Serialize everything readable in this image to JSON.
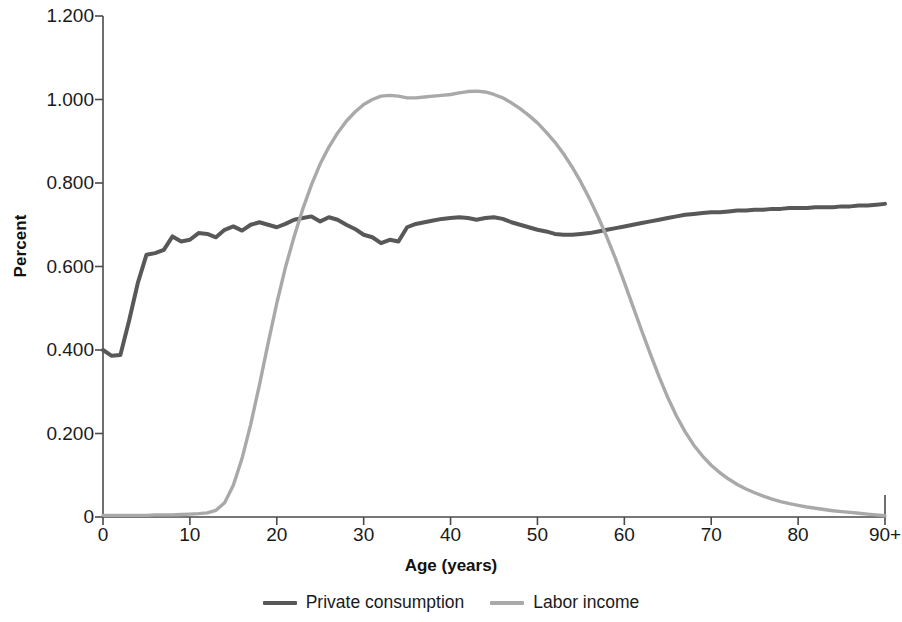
{
  "chart_data": {
    "type": "line",
    "title": "",
    "xlabel": "Age (years)",
    "ylabel": "Percent",
    "xlim": [
      0,
      90
    ],
    "ylim": [
      0,
      1.2
    ],
    "grid": false,
    "legend_position": "bottom-center",
    "x_tick_labels": [
      "0",
      "10",
      "20",
      "30",
      "40",
      "50",
      "60",
      "70",
      "80",
      "90+"
    ],
    "x_tick_values": [
      0,
      10,
      20,
      30,
      40,
      50,
      60,
      70,
      80,
      90
    ],
    "y_tick_labels": [
      "0",
      "0.200",
      "0.400",
      "0.600",
      "0.800",
      "1.000",
      "1.200"
    ],
    "y_tick_values": [
      0,
      0.2,
      0.4,
      0.6,
      0.8,
      1.0,
      1.2
    ],
    "x": [
      0,
      1,
      2,
      3,
      4,
      5,
      6,
      7,
      8,
      9,
      10,
      11,
      12,
      13,
      14,
      15,
      16,
      17,
      18,
      19,
      20,
      21,
      22,
      23,
      24,
      25,
      26,
      27,
      28,
      29,
      30,
      31,
      32,
      33,
      34,
      35,
      36,
      37,
      38,
      39,
      40,
      41,
      42,
      43,
      44,
      45,
      46,
      47,
      48,
      49,
      50,
      51,
      52,
      53,
      54,
      55,
      56,
      57,
      58,
      59,
      60,
      61,
      62,
      63,
      64,
      65,
      66,
      67,
      68,
      69,
      70,
      71,
      72,
      73,
      74,
      75,
      76,
      77,
      78,
      79,
      80,
      81,
      82,
      83,
      84,
      85,
      86,
      87,
      88,
      89,
      90
    ],
    "series": [
      {
        "name": "Private consumption",
        "color": "#585858",
        "values": [
          0.4,
          0.386,
          0.388,
          0.47,
          0.56,
          0.628,
          0.632,
          0.64,
          0.672,
          0.66,
          0.664,
          0.68,
          0.678,
          0.67,
          0.688,
          0.696,
          0.686,
          0.7,
          0.706,
          0.7,
          0.694,
          0.702,
          0.712,
          0.716,
          0.72,
          0.708,
          0.718,
          0.712,
          0.7,
          0.69,
          0.676,
          0.67,
          0.656,
          0.664,
          0.66,
          0.694,
          0.702,
          0.706,
          0.71,
          0.714,
          0.716,
          0.718,
          0.716,
          0.712,
          0.716,
          0.718,
          0.714,
          0.706,
          0.7,
          0.694,
          0.688,
          0.684,
          0.678,
          0.676,
          0.676,
          0.678,
          0.68,
          0.684,
          0.688,
          0.692,
          0.696,
          0.7,
          0.704,
          0.708,
          0.712,
          0.716,
          0.72,
          0.724,
          0.726,
          0.728,
          0.73,
          0.73,
          0.732,
          0.734,
          0.734,
          0.736,
          0.736,
          0.738,
          0.738,
          0.74,
          0.74,
          0.74,
          0.742,
          0.742,
          0.742,
          0.744,
          0.744,
          0.746,
          0.746,
          0.748,
          0.75
        ]
      },
      {
        "name": "Labor income",
        "color": "#a9a9a9",
        "values": [
          0.004,
          0.004,
          0.004,
          0.004,
          0.004,
          0.004,
          0.005,
          0.005,
          0.005,
          0.006,
          0.007,
          0.008,
          0.01,
          0.016,
          0.034,
          0.076,
          0.14,
          0.222,
          0.316,
          0.416,
          0.512,
          0.598,
          0.672,
          0.738,
          0.796,
          0.846,
          0.886,
          0.92,
          0.948,
          0.97,
          0.988,
          1.0,
          1.008,
          1.01,
          1.008,
          1.004,
          1.004,
          1.006,
          1.008,
          1.01,
          1.012,
          1.016,
          1.019,
          1.02,
          1.018,
          1.012,
          1.004,
          0.992,
          0.978,
          0.962,
          0.944,
          0.922,
          0.898,
          0.87,
          0.838,
          0.802,
          0.762,
          0.718,
          0.67,
          0.618,
          0.562,
          0.504,
          0.446,
          0.39,
          0.336,
          0.286,
          0.242,
          0.204,
          0.172,
          0.146,
          0.124,
          0.106,
          0.091,
          0.078,
          0.067,
          0.058,
          0.05,
          0.043,
          0.037,
          0.032,
          0.028,
          0.024,
          0.021,
          0.018,
          0.015,
          0.013,
          0.011,
          0.009,
          0.007,
          0.005,
          0.003
        ]
      }
    ]
  },
  "axis": {
    "ylabel": "Percent",
    "xlabel": "Age (years)"
  },
  "legend": {
    "items": [
      {
        "label": "Private consumption",
        "color": "#585858"
      },
      {
        "label": "Labor income",
        "color": "#a9a9a9"
      }
    ]
  }
}
